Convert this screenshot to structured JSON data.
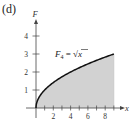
{
  "panel_label": "(d)",
  "chart_data": {
    "type": "area",
    "title": "",
    "function_label": "F_4 = √x",
    "function_label_main": "F",
    "function_label_sub": "4",
    "function_label_eq": " = ",
    "function_label_expr": "√x",
    "xlabel": "x",
    "ylabel": "F",
    "xlim": [
      0,
      9.5
    ],
    "ylim": [
      0,
      4.5
    ],
    "x_ticks": [
      1,
      2,
      3,
      4,
      5,
      6,
      7,
      8,
      9
    ],
    "x_tick_labels": [
      "2",
      "4",
      "6",
      "8"
    ],
    "x_tick_label_values": [
      2,
      4,
      6,
      8
    ],
    "y_ticks": [
      1,
      2,
      3,
      4
    ],
    "y_tick_labels": [
      "1",
      "2",
      "3",
      "4"
    ],
    "shaded_region": {
      "from": 0,
      "to": 9,
      "color": "#d2d2d2"
    },
    "curve_color": "#111111",
    "x": [
      0,
      0.25,
      0.5,
      1,
      2,
      3,
      4,
      5,
      6,
      7,
      8,
      9
    ],
    "values": [
      0,
      0.5,
      0.707,
      1,
      1.414,
      1.732,
      2,
      2.236,
      2.449,
      2.646,
      2.828,
      3
    ],
    "grid": false,
    "legend": "none"
  }
}
